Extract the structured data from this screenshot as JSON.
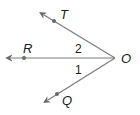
{
  "diagram": {
    "type": "angle-rays",
    "vertex": {
      "label": "O",
      "x": 115,
      "y": 58
    },
    "rays": [
      {
        "name": "OT",
        "point_label": "T",
        "tip": [
          42,
          14
        ],
        "dot": [
          54,
          21
        ],
        "label_pos": [
          63,
          18
        ]
      },
      {
        "name": "OR",
        "point_label": "R",
        "tip": [
          9,
          58
        ],
        "dot": [
          24,
          58
        ],
        "label_pos": [
          24,
          52
        ]
      },
      {
        "name": "OQ",
        "point_label": "Q",
        "tip": [
          46,
          101
        ],
        "dot": [
          57,
          94
        ],
        "label_pos": [
          63,
          105
        ]
      }
    ],
    "angles": [
      {
        "label": "2",
        "between": [
          "OT",
          "OR"
        ],
        "label_pos": [
          77,
          51
        ]
      },
      {
        "label": "1",
        "between": [
          "OR",
          "OQ"
        ],
        "label_pos": [
          77,
          73
        ]
      }
    ],
    "colors": {
      "ray": "#7a7a7a",
      "dot": "#6a6a6a",
      "text": "#1a1a1a"
    }
  }
}
